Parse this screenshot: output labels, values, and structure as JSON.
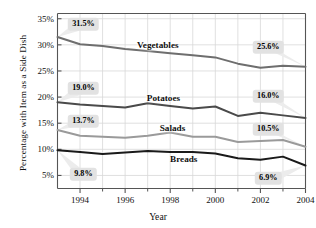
{
  "chart_data": {
    "type": "line",
    "title": "",
    "xlabel": "Year",
    "ylabel": "Percentage with Item as a Side Dish",
    "x": [
      1993,
      1994,
      1995,
      1996,
      1997,
      1998,
      1999,
      2000,
      2001,
      2002,
      2003,
      2004
    ],
    "xlim": [
      1993,
      2004
    ],
    "ylim": [
      2.5,
      36.0
    ],
    "grid": true,
    "legend_position": "inline-labels",
    "x_major_ticks": [
      "1994",
      "1996",
      "1998",
      "2000",
      "2002",
      "2004"
    ],
    "x_major_tick_values": [
      1994,
      1996,
      1998,
      2000,
      2002,
      2004
    ],
    "x_minor_tick_values": [
      1995,
      1997,
      1999,
      2001,
      2003
    ],
    "y_ticks": [
      "5%",
      "10%",
      "15%",
      "20%",
      "25%",
      "30%",
      "35%"
    ],
    "y_tick_values": [
      5,
      10,
      15,
      20,
      25,
      30,
      35
    ],
    "series": [
      {
        "name": "Vegetables",
        "color": "#6e6e6e",
        "width": 2.0,
        "values": [
          31.5,
          30.1,
          29.8,
          29.2,
          28.8,
          28.4,
          28.0,
          27.6,
          26.4,
          25.6,
          26.0,
          25.8
        ],
        "label_x": 1997.45,
        "label_y": 29.9,
        "start_callout": "31.5%",
        "end_callout": "25.6%"
      },
      {
        "name": "Potatoes",
        "color": "#4a4a4a",
        "width": 2.0,
        "values": [
          19.0,
          18.6,
          18.3,
          18.0,
          18.8,
          18.3,
          17.8,
          18.2,
          16.4,
          17.0,
          16.5,
          16.0
        ],
        "label_x": 1997.7,
        "label_y": 19.9,
        "start_callout": "19.0%",
        "end_callout": "16.0%"
      },
      {
        "name": "Salads",
        "color": "#9a9a9a",
        "width": 2.0,
        "values": [
          13.7,
          12.6,
          12.4,
          12.2,
          12.6,
          13.2,
          12.4,
          12.4,
          11.4,
          11.6,
          11.8,
          10.5
        ],
        "label_x": 1998.1,
        "label_y": 14.0,
        "start_callout": "13.7%",
        "end_callout": "10.5%"
      },
      {
        "name": "Breads",
        "color": "#1a1a1a",
        "width": 2.0,
        "values": [
          9.8,
          9.5,
          9.1,
          9.4,
          9.7,
          9.5,
          9.5,
          9.2,
          8.3,
          8.0,
          8.6,
          6.9
        ],
        "label_x": 1998.6,
        "label_y": 8.2,
        "start_callout": "9.8%",
        "end_callout": "6.9%"
      }
    ],
    "callouts": [
      {
        "name": "vegetables-start",
        "text": "31.5%",
        "x": 1994.15,
        "y": 34.0,
        "anchor_x": 1993.0,
        "anchor_y": 31.5
      },
      {
        "name": "vegetables-end",
        "text": "25.6%",
        "x": 2002.35,
        "y": 29.6,
        "anchor_x": 2004.0,
        "anchor_y": 25.8
      },
      {
        "name": "potatoes-start",
        "text": "19.0%",
        "x": 1994.15,
        "y": 21.7,
        "anchor_x": 1993.0,
        "anchor_y": 19.0
      },
      {
        "name": "potatoes-end",
        "text": "16.0%",
        "x": 2002.35,
        "y": 20.2,
        "anchor_x": 2004.0,
        "anchor_y": 16.0
      },
      {
        "name": "salads-start",
        "text": "13.7%",
        "x": 1994.15,
        "y": 15.4,
        "anchor_x": 1993.0,
        "anchor_y": 13.7
      },
      {
        "name": "salads-end",
        "text": "10.5%",
        "x": 2002.35,
        "y": 13.8,
        "anchor_x": 2004.0,
        "anchor_y": 10.5
      },
      {
        "name": "breads-start",
        "text": "9.8%",
        "x": 1994.15,
        "y": 5.2,
        "anchor_x": 1993.0,
        "anchor_y": 9.8
      },
      {
        "name": "breads-end",
        "text": "6.9%",
        "x": 2002.35,
        "y": 4.5,
        "anchor_x": 2004.0,
        "anchor_y": 6.9
      }
    ],
    "style": {
      "grid_color": "#d8d8d8",
      "axis_color": "#555555",
      "callout_bg": "#e2e2e2",
      "callout_text": "#000000",
      "background": "#ffffff"
    }
  }
}
